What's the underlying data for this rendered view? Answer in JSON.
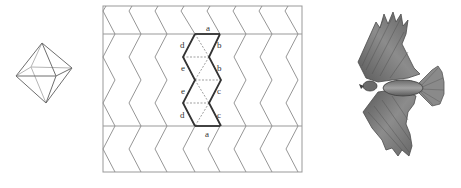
{
  "figure": {
    "panels": [
      {
        "id": "octahedron",
        "label": "Octahedron wireframe"
      },
      {
        "id": "tiling",
        "label": "Zigzag tiling net"
      },
      {
        "id": "bird",
        "label": "Bird in flight illustration"
      }
    ]
  },
  "tiling": {
    "edge_labels": {
      "top": "a",
      "left_1": "d",
      "left_2": "e",
      "left_3": "e",
      "left_4": "d",
      "right_1": "b",
      "right_2": "b",
      "right_3": "c",
      "right_4": "c",
      "bottom": "a"
    }
  },
  "colors": {
    "line_light": "#8a8a8a",
    "line_dark": "#333333",
    "frame": "#999999",
    "dashed": "#777777",
    "bird_dark": "#4a4a4a",
    "bird_mid": "#7d7d7d",
    "bird_light": "#a8a8a8"
  }
}
